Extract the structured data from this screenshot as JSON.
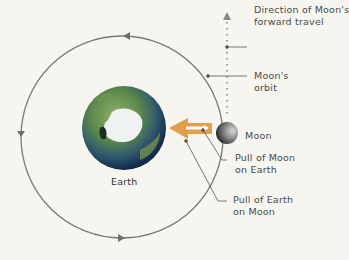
{
  "diagram": {
    "type": "orbital-forces",
    "bodies": {
      "earth": {
        "label": "Earth"
      },
      "moon": {
        "label": "Moon"
      }
    },
    "labels": {
      "direction_line1": "Direction of Moon's",
      "direction_line2": "forward travel",
      "orbit_line1": "Moon's",
      "orbit_line2": "orbit",
      "pull_moon_line1": "Pull of Moon",
      "pull_moon_line2": "on Earth",
      "pull_earth_line1": "Pull of Earth",
      "pull_earth_line2": "on Moon"
    },
    "colors": {
      "background": "#f6f5f0",
      "orbit": "#7a7a7a",
      "arrow_earth_pull": "#e0a04a",
      "arrow_moon_pull": "#ffffff",
      "leader": "#555555"
    }
  }
}
